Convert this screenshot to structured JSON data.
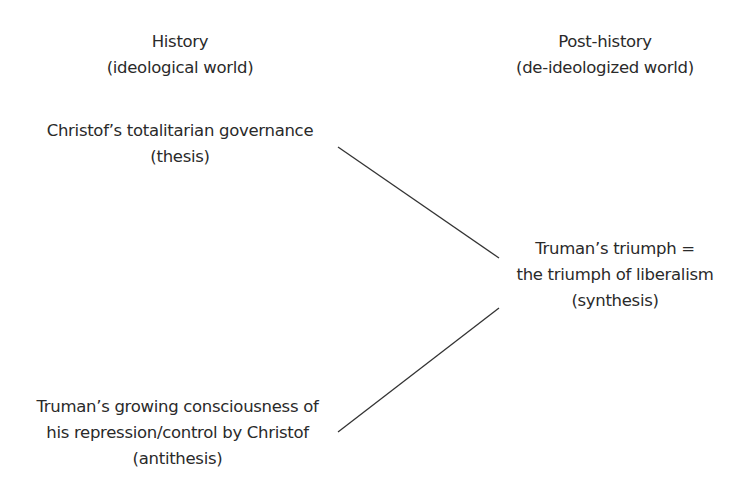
{
  "headers": {
    "left": {
      "title": "History",
      "subtitle": "(ideological world)"
    },
    "right": {
      "title": "Post-history",
      "subtitle": "(de-ideologized world)"
    }
  },
  "nodes": {
    "thesis": {
      "lines": [
        "Christof’s totalitarian governance",
        "(thesis)"
      ]
    },
    "antithesis": {
      "lines": [
        "Truman’s growing consciousness of",
        "his repression/control by Christof",
        "(antithesis)"
      ]
    },
    "synthesis": {
      "lines": [
        "Truman’s triumph =",
        "the triumph of liberalism",
        "(synthesis)"
      ]
    }
  },
  "colors": {
    "text": "#2a2a2a",
    "line": "#333333",
    "background": "#ffffff"
  }
}
